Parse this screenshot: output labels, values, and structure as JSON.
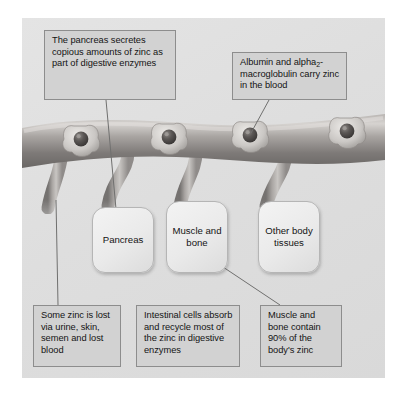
{
  "figure": {
    "panel_background": "#dedede"
  },
  "callouts": [
    {
      "id": "pancreas-secretes",
      "text": "The pancreas secretes copious amounts of zinc as part of digestive enzymes",
      "position": "top-left"
    },
    {
      "id": "albumin",
      "text_before_sub": "Albumin and alpha",
      "subscript": "2",
      "text_after_sub": "-macroglobulin carry zinc in the blood",
      "position": "top-right"
    },
    {
      "id": "some-zinc-lost",
      "text": "Some zinc is lost via urine, skin, semen and lost blood",
      "position": "bottom-left"
    },
    {
      "id": "intestinal-cells",
      "text": "Intestinal cells absorb and recycle most of the zinc in digestive enzymes",
      "position": "bottom-center"
    },
    {
      "id": "muscle-bone-90",
      "text": "Muscle and bone contain 90% of the body's zinc",
      "position": "bottom-right"
    }
  ],
  "tissues": [
    {
      "id": "pancreas",
      "label": "Pancreas"
    },
    {
      "id": "muscle-and-bone",
      "label": "Muscle and bone"
    },
    {
      "id": "other-body-tissues",
      "label": "Other body tissues"
    }
  ],
  "illustration": {
    "vessel_name": "blood-vessel",
    "branch_count": 4,
    "zinc_complex_count": 4,
    "zinc_complex_name": "protein-bound-zinc-ion",
    "colors": {
      "vessel_light": "#c9c6c4",
      "vessel_mid": "#9d9996",
      "vessel_dark": "#6e6a68",
      "zinc_ion": "#4f4c4b",
      "protein": "#d8d5d2",
      "leader_line": "#6f6f6f",
      "box_fill": "#d2d2d2",
      "box_border": "#8d8d8d",
      "tissue_fill": "#ededed",
      "tissue_border": "#b5b5b5",
      "panel": "#dedede",
      "page": "#ffffff"
    }
  }
}
